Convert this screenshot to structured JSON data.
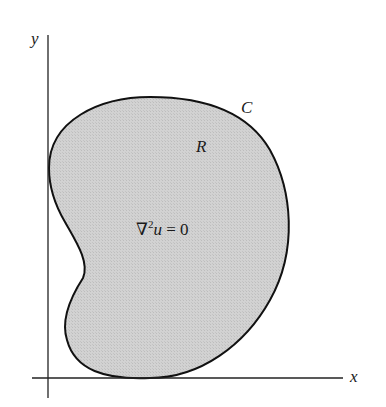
{
  "diagram": {
    "axes": {
      "x_label": "x",
      "y_label": "y"
    },
    "region": {
      "boundary_label": "C",
      "region_label": "R",
      "equation": {
        "operator": "∇",
        "superscript": "2",
        "variable": "u",
        "rhs": " = 0"
      },
      "fill_color": "#cfcfcf",
      "stroke_color": "#111111"
    }
  }
}
